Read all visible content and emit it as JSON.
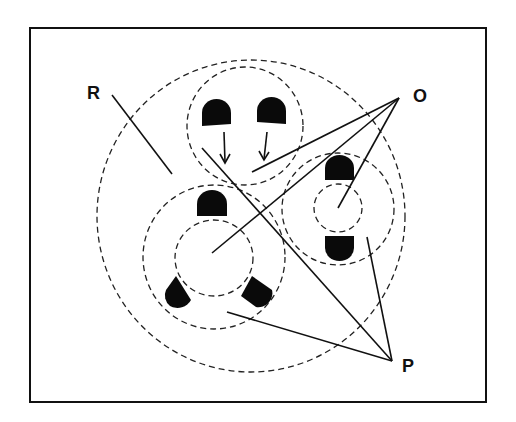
{
  "labels": {
    "R": "R",
    "O": "O",
    "P": "P"
  },
  "colors": {
    "ink": "#111111",
    "background": "#ffffff"
  },
  "frame": {
    "x": 30,
    "y": 28,
    "width": 456,
    "height": 374
  }
}
